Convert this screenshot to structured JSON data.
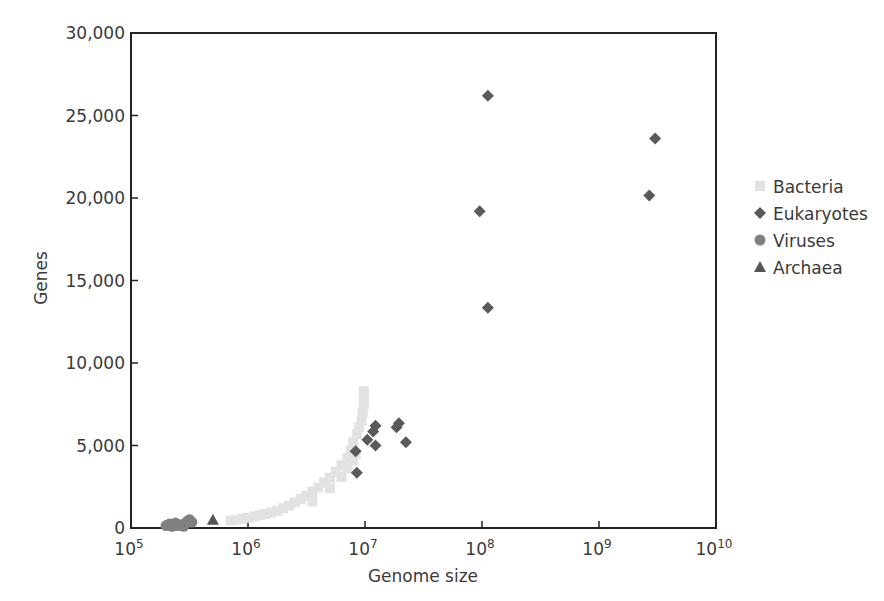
{
  "chart_data": {
    "type": "scatter",
    "title": "",
    "xlabel": "Genome size",
    "ylabel": "Genes",
    "xscale": "log",
    "xlim": [
      100000,
      10000000000
    ],
    "ylim": [
      0,
      30000
    ],
    "x_ticks": [
      {
        "base": "10",
        "exp": "5",
        "value": 100000
      },
      {
        "base": "10",
        "exp": "6",
        "value": 1000000
      },
      {
        "base": "10",
        "exp": "7",
        "value": 10000000
      },
      {
        "base": "10",
        "exp": "8",
        "value": 100000000
      },
      {
        "base": "10",
        "exp": "9",
        "value": 1000000000
      },
      {
        "base": "10",
        "exp": "10",
        "value": 10000000000
      }
    ],
    "y_ticks": [
      {
        "label": "0",
        "value": 0
      },
      {
        "label": "5,000",
        "value": 5000
      },
      {
        "label": "10,000",
        "value": 10000
      },
      {
        "label": "15,000",
        "value": 15000
      },
      {
        "label": "20,000",
        "value": 20000
      },
      {
        "label": "25,000",
        "value": 25000
      },
      {
        "label": "30,000",
        "value": 30000
      }
    ],
    "grid": false,
    "legend_position": "right",
    "series": [
      {
        "name": "Bacteria",
        "marker": "square",
        "color": "#e2e2e2",
        "points_log10x_genes": [
          [
            5.85,
            450
          ],
          [
            5.9,
            500
          ],
          [
            5.95,
            560
          ],
          [
            6.0,
            620
          ],
          [
            6.05,
            700
          ],
          [
            6.1,
            780
          ],
          [
            6.15,
            850
          ],
          [
            6.2,
            950
          ],
          [
            6.25,
            1050
          ],
          [
            6.3,
            1200
          ],
          [
            6.35,
            1350
          ],
          [
            6.4,
            1550
          ],
          [
            6.45,
            1750
          ],
          [
            6.5,
            1950
          ],
          [
            6.55,
            2200
          ],
          [
            6.6,
            2450
          ],
          [
            6.65,
            2750
          ],
          [
            6.7,
            3050
          ],
          [
            6.75,
            3400
          ],
          [
            6.8,
            3800
          ],
          [
            6.85,
            4250
          ],
          [
            6.88,
            4700
          ],
          [
            6.9,
            5200
          ],
          [
            6.93,
            5700
          ],
          [
            6.95,
            6100
          ],
          [
            6.97,
            6500
          ],
          [
            6.98,
            7000
          ],
          [
            6.99,
            7500
          ],
          [
            6.99,
            8000
          ],
          [
            6.99,
            8300
          ],
          [
            6.55,
            1600
          ],
          [
            6.7,
            2400
          ],
          [
            6.8,
            3100
          ],
          [
            6.85,
            3600
          ],
          [
            6.9,
            4100
          ],
          [
            6.92,
            4500
          ]
        ]
      },
      {
        "name": "Eukaryotes",
        "marker": "diamond",
        "color": "#5a5a5a",
        "points_log10x_genes": [
          [
            8.05,
            26200
          ],
          [
            9.48,
            23600
          ],
          [
            9.43,
            20150
          ],
          [
            7.98,
            19200
          ],
          [
            8.05,
            13350
          ],
          [
            7.09,
            6200
          ],
          [
            7.07,
            5850
          ],
          [
            7.02,
            5350
          ],
          [
            7.09,
            5000
          ],
          [
            6.92,
            4650
          ],
          [
            6.93,
            3350
          ],
          [
            7.29,
            6350
          ],
          [
            7.27,
            6100
          ],
          [
            7.35,
            5200
          ]
        ]
      },
      {
        "name": "Viruses",
        "marker": "circle",
        "color": "#808080",
        "points_log10x_genes": [
          [
            5.3,
            150
          ],
          [
            5.33,
            250
          ],
          [
            5.36,
            200
          ],
          [
            5.38,
            300
          ],
          [
            5.4,
            150
          ],
          [
            5.43,
            200
          ],
          [
            5.46,
            250
          ],
          [
            5.48,
            400
          ],
          [
            5.5,
            500
          ],
          [
            5.52,
            350
          ],
          [
            5.45,
            100
          ],
          [
            5.35,
            100
          ]
        ]
      },
      {
        "name": "Archaea",
        "marker": "triangle",
        "color": "#555555",
        "points_log10x_genes": [
          [
            5.7,
            500
          ]
        ]
      }
    ]
  },
  "legend": [
    {
      "label": "Bacteria",
      "marker": "square",
      "color": "#e2e2e2"
    },
    {
      "label": "Eukaryotes",
      "marker": "diamond",
      "color": "#5a5a5a"
    },
    {
      "label": "Viruses",
      "marker": "circle",
      "color": "#808080"
    },
    {
      "label": "Archaea",
      "marker": "triangle",
      "color": "#555555"
    }
  ]
}
